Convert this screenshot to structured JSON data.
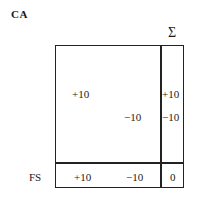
{
  "title": "CA",
  "sum_header": "Σ",
  "matrix": {
    "rows": [
      {
        "entries": [
          "+10",
          ""
        ],
        "sum": "+10"
      },
      {
        "entries": [
          "",
          "−10"
        ],
        "sum": "−10"
      }
    ]
  },
  "footer": {
    "label": "FS",
    "values": [
      "+10",
      "−10"
    ],
    "total": "0"
  }
}
